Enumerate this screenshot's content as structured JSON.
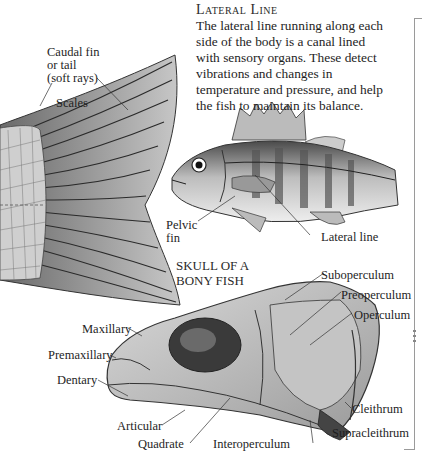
{
  "lateral_line": {
    "heading": "Lateral Line",
    "text_lines": [
      "The lateral line running along each",
      "side of the body is a canal lined",
      "with sensory organs. These detect",
      "vibrations and changes in",
      "temperature and pressure, and help",
      "the fish to maintain its balance."
    ]
  },
  "tail_labels": {
    "caudal_fin": [
      "Caudal fin",
      "or tail",
      "(soft rays)"
    ],
    "scales": "Scales"
  },
  "fish_labels": {
    "pelvic_fin": [
      "Pelvic",
      "fin"
    ],
    "lateral_line": "Lateral line"
  },
  "skull": {
    "title": [
      "SKULL OF A",
      "BONY FISH"
    ],
    "labels": {
      "suboperculum": "Suboperculum",
      "preoperculum": "Preoperculum",
      "operculum": "Operculum",
      "maxillary": "Maxillary",
      "premaxillary": "Premaxillary",
      "dentary": "Dentary",
      "cleithrum": "Cleithrum",
      "articular": "Articular",
      "supracleithrum": "Supracleithrum",
      "quadrate": "Quadrate",
      "interoperculum": "Interoperculum"
    }
  },
  "colors": {
    "ink": "#1e1e1e",
    "frame": "#9a9a9a",
    "shade_dark": "#3a3a3a",
    "shade_mid": "#8a8a8a",
    "shade_light": "#d8d8d8"
  }
}
